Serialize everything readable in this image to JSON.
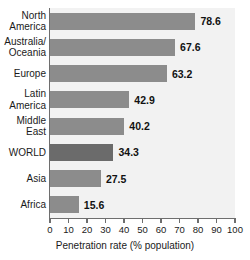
{
  "chart_data": {
    "type": "bar",
    "orientation": "horizontal",
    "title": "",
    "subtitle": "",
    "xlabel": "Penetration rate (% population)",
    "ylabel": "",
    "xlim": [
      0,
      100
    ],
    "xticks": [
      0,
      10,
      20,
      30,
      40,
      50,
      60,
      70,
      80,
      90,
      100
    ],
    "xtick_labels": [
      "0",
      "10",
      "20",
      "30",
      "40",
      "50",
      "60",
      "70",
      "80",
      "90",
      "100"
    ],
    "grid": false,
    "legend": null,
    "categories": [
      "North America",
      "Australia/ Oceania",
      "Europe",
      "Latin America",
      "Middle East",
      "WORLD",
      "Asia",
      "Africa"
    ],
    "category_lines": [
      [
        "North",
        "America"
      ],
      [
        "Australia/",
        "Oceania"
      ],
      [
        "Europe"
      ],
      [
        "Latin",
        "America"
      ],
      [
        "Middle",
        "East"
      ],
      [
        "WORLD"
      ],
      [
        "Asia"
      ],
      [
        "Africa"
      ]
    ],
    "values": [
      78.6,
      67.6,
      63.2,
      42.9,
      40.2,
      34.3,
      27.5,
      15.6
    ],
    "value_labels": [
      "78.6",
      "67.6",
      "63.2",
      "42.9",
      "40.2",
      "34.3",
      "27.5",
      "15.6"
    ],
    "highlight_index": 5,
    "colors": {
      "bar": "#8c8c8c",
      "bar_highlight": "#6b6b6b",
      "plot_background": "#f2f2f2",
      "axis": "#6e6e6e",
      "text": "#1a1a1a",
      "page_background": "#ffffff"
    }
  }
}
